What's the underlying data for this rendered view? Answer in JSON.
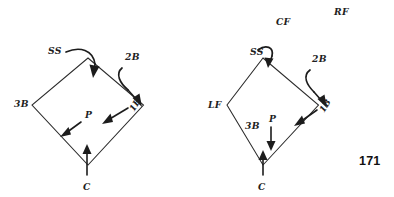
{
  "page": {
    "page_number": "171",
    "background_color": "#ffffff",
    "ink_color": "#1c1c1c"
  },
  "figures": [
    {
      "id": "left-diamond",
      "name": "infield-coverage-diagram-left",
      "outfield_labels": [],
      "base_labels": [
        {
          "key": "ss",
          "text": "SS",
          "x": 48,
          "y": 54,
          "rotate": 0
        },
        {
          "key": "2b",
          "text": "2B",
          "x": 125,
          "y": 60,
          "rotate": 0
        },
        {
          "key": "3b",
          "text": "3B",
          "x": 14,
          "y": 107,
          "rotate": 0
        },
        {
          "key": "1b",
          "text": "1B",
          "x": 134,
          "y": 112,
          "rotate": -58
        },
        {
          "key": "p",
          "text": "P",
          "x": 85,
          "y": 118,
          "rotate": 0
        },
        {
          "key": "c",
          "text": "C",
          "x": 83,
          "y": 190,
          "rotate": 0
        }
      ],
      "movements": [
        {
          "key": "ss-to-2b",
          "from": "SS",
          "to": "second base",
          "style": "curved"
        },
        {
          "key": "2b-to-1b",
          "from": "2B",
          "to": "first base",
          "style": "curved"
        },
        {
          "key": "1b-inward",
          "from": "1B",
          "to": "toward mound",
          "style": "straight"
        },
        {
          "key": "p-to-3b",
          "from": "P",
          "to": "toward third base line",
          "style": "straight"
        },
        {
          "key": "c-to-mound",
          "from": "C",
          "to": "toward mound",
          "style": "straight"
        }
      ]
    },
    {
      "id": "right-diamond",
      "name": "infield-coverage-diagram-right",
      "outfield_labels": [
        {
          "key": "cf",
          "text": "CF",
          "x": 276,
          "y": 25
        },
        {
          "key": "rf",
          "text": "RF",
          "x": 334,
          "y": 15
        }
      ],
      "base_labels": [
        {
          "key": "ss",
          "text": "SS",
          "x": 250,
          "y": 55,
          "rotate": 0
        },
        {
          "key": "2b",
          "text": "2B",
          "x": 312,
          "y": 62,
          "rotate": 0
        },
        {
          "key": "lf",
          "text": "LF",
          "x": 208,
          "y": 108,
          "rotate": 0
        },
        {
          "key": "3b",
          "text": "3B",
          "x": 245,
          "y": 129,
          "rotate": 0
        },
        {
          "key": "1b",
          "text": "1B",
          "x": 324,
          "y": 113,
          "rotate": -58
        },
        {
          "key": "p",
          "text": "P",
          "x": 269,
          "y": 122,
          "rotate": 0
        },
        {
          "key": "c",
          "text": "C",
          "x": 258,
          "y": 190,
          "rotate": 0
        }
      ],
      "movements": [
        {
          "key": "ss-to-2b",
          "from": "SS",
          "to": "second base",
          "style": "curved-short"
        },
        {
          "key": "2b-to-1b",
          "from": "2B",
          "to": "first base",
          "style": "curved"
        },
        {
          "key": "1b-inward",
          "from": "1B",
          "to": "toward mound",
          "style": "straight"
        },
        {
          "key": "p-down",
          "from": "P",
          "to": "toward home plate",
          "style": "straight"
        },
        {
          "key": "c-to-mound",
          "from": "C",
          "to": "toward mound",
          "style": "straight"
        }
      ]
    }
  ]
}
